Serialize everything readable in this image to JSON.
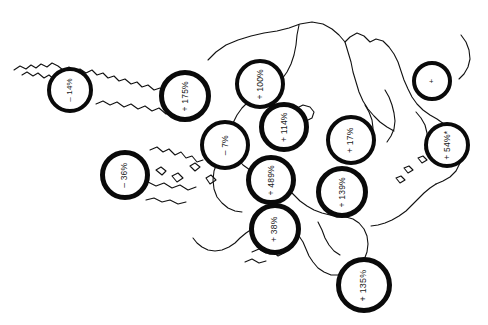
{
  "figure": {
    "type": "map",
    "title": "",
    "background_color": "#ffffff",
    "outline_color": "#111111",
    "marker_stroke_color": "#0a0a0a",
    "marker_fill_color": "#ffffff",
    "label_color": "#1a1a1a",
    "label_rotation_degrees": -90,
    "width": 488,
    "height": 325
  },
  "markers": [
    {
      "id": "marker-1",
      "label": "– 14%",
      "sign": "negative",
      "value": -14,
      "cx": 70,
      "cy": 90,
      "r": 23,
      "stroke_width": 4,
      "font_size": 8
    },
    {
      "id": "marker-2",
      "label": "+ 175%",
      "sign": "positive",
      "value": 175,
      "cx": 185,
      "cy": 96,
      "r": 26,
      "stroke_width": 5,
      "font_size": 8.5
    },
    {
      "id": "marker-3",
      "label": "+ 100%",
      "sign": "positive",
      "value": 100,
      "cx": 260,
      "cy": 84,
      "r": 25,
      "stroke_width": 4,
      "font_size": 8.5
    },
    {
      "id": "marker-4",
      "label": "+",
      "sign": "positive",
      "value": null,
      "cx": 432,
      "cy": 81,
      "r": 20,
      "stroke_width": 4,
      "font_size": 8
    },
    {
      "id": "marker-5",
      "label": "+ 114%",
      "sign": "positive",
      "value": 114,
      "cx": 284,
      "cy": 127,
      "r": 25,
      "stroke_width": 5,
      "font_size": 8.5
    },
    {
      "id": "marker-6",
      "label": "– 7%",
      "sign": "negative",
      "value": -7,
      "cx": 225,
      "cy": 145,
      "r": 25,
      "stroke_width": 4,
      "font_size": 8.5
    },
    {
      "id": "marker-7",
      "label": "+ 17%",
      "sign": "positive",
      "value": 17,
      "cx": 351,
      "cy": 140,
      "r": 25,
      "stroke_width": 4.5,
      "font_size": 8.5
    },
    {
      "id": "marker-8",
      "label": "+ 54%*",
      "sign": "positive",
      "value": 54,
      "cx": 447,
      "cy": 145,
      "r": 23,
      "stroke_width": 4,
      "font_size": 8.5
    },
    {
      "id": "marker-9",
      "label": "– 36%",
      "sign": "negative",
      "value": -36,
      "cx": 125,
      "cy": 175,
      "r": 25,
      "stroke_width": 5,
      "font_size": 8.5
    },
    {
      "id": "marker-10",
      "label": "+ 489%",
      "sign": "positive",
      "value": 489,
      "cx": 271,
      "cy": 180,
      "r": 25,
      "stroke_width": 5,
      "font_size": 8.5
    },
    {
      "id": "marker-11",
      "label": "+ 139%",
      "sign": "positive",
      "value": 139,
      "cx": 342,
      "cy": 192,
      "r": 26,
      "stroke_width": 5,
      "font_size": 8.5
    },
    {
      "id": "marker-12",
      "label": "+ 38%",
      "sign": "positive",
      "value": 38,
      "cx": 275,
      "cy": 229,
      "r": 26,
      "stroke_width": 5,
      "font_size": 8.5
    },
    {
      "id": "marker-13",
      "label": "+ 135%",
      "sign": "positive",
      "value": 135,
      "cx": 364,
      "cy": 285,
      "r": 28,
      "stroke_width": 5,
      "font_size": 9
    }
  ]
}
